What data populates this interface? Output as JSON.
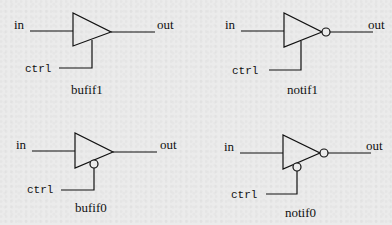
{
  "diagram": {
    "gates": [
      {
        "name": "bufif1",
        "input_label": "in",
        "output_label": "out",
        "control_label": "ctrl",
        "inverted_output": false,
        "active_low_control": false
      },
      {
        "name": "notif1",
        "input_label": "in",
        "output_label": "out",
        "control_label": "ctrl",
        "inverted_output": true,
        "active_low_control": false
      },
      {
        "name": "bufif0",
        "input_label": "in",
        "output_label": "out",
        "control_label": "ctrl",
        "inverted_output": false,
        "active_low_control": true
      },
      {
        "name": "notif0",
        "input_label": "in",
        "output_label": "out",
        "control_label": "ctrl",
        "inverted_output": true,
        "active_low_control": true
      }
    ],
    "colors": {
      "background": "#ebebeb",
      "ink": "#111111"
    }
  }
}
